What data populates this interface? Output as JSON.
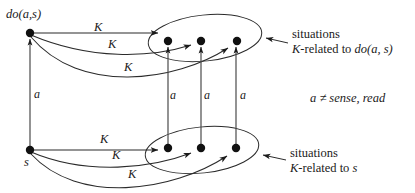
{
  "figure": {
    "nodes": {
      "top_source": {
        "label": "do(a,s)",
        "x": 30,
        "y": 33,
        "label_x": 6,
        "label_y": 10
      },
      "bottom_source": {
        "label": "s",
        "x": 30,
        "y": 150,
        "label_x": 24,
        "label_y": 158
      },
      "top_targets": [
        {
          "x": 168,
          "y": 41
        },
        {
          "x": 201,
          "y": 41
        },
        {
          "x": 237,
          "y": 41
        }
      ],
      "bottom_targets": [
        {
          "x": 168,
          "y": 148
        },
        {
          "x": 201,
          "y": 148
        },
        {
          "x": 236,
          "y": 148
        }
      ]
    },
    "ellipses": {
      "top": {
        "cx": 205,
        "cy": 38,
        "rx": 57,
        "ry": 24,
        "rotate": -6
      },
      "bottom": {
        "cx": 202,
        "cy": 150,
        "rx": 57,
        "ry": 24,
        "rotate": -6
      }
    },
    "k_labels_top": [
      {
        "text": "K",
        "x": 94,
        "y": 21
      },
      {
        "text": "K",
        "x": 108,
        "y": 38
      },
      {
        "text": "K",
        "x": 124,
        "y": 61
      }
    ],
    "k_labels_bottom": [
      {
        "text": "K",
        "x": 100,
        "y": 134
      },
      {
        "text": "K",
        "x": 112,
        "y": 150
      },
      {
        "text": "K",
        "x": 128,
        "y": 169
      }
    ],
    "a_labels": [
      {
        "text": "a",
        "x": 34,
        "y": 88
      },
      {
        "text": "a",
        "x": 170,
        "y": 90
      },
      {
        "text": "a",
        "x": 204,
        "y": 90
      },
      {
        "text": "a",
        "x": 240,
        "y": 90
      }
    ],
    "condition": {
      "text": "a ≠ sense, read",
      "x": 310,
      "y": 93
    },
    "callout_top": {
      "line1": "situations",
      "line2_prefix": "K",
      "line2_suffix": "-related to ",
      "line2_term": "do(a, s)",
      "x": 292,
      "y": 28
    },
    "callout_bottom": {
      "line1": "situations",
      "line2_prefix": "K",
      "line2_suffix": "-related to ",
      "line2_term": "s",
      "x": 290,
      "y": 147
    },
    "colors": {
      "stroke": "#2b2b2b",
      "node_fill": "#111111",
      "text": "#1a1a1a",
      "background": "#ffffff"
    }
  }
}
